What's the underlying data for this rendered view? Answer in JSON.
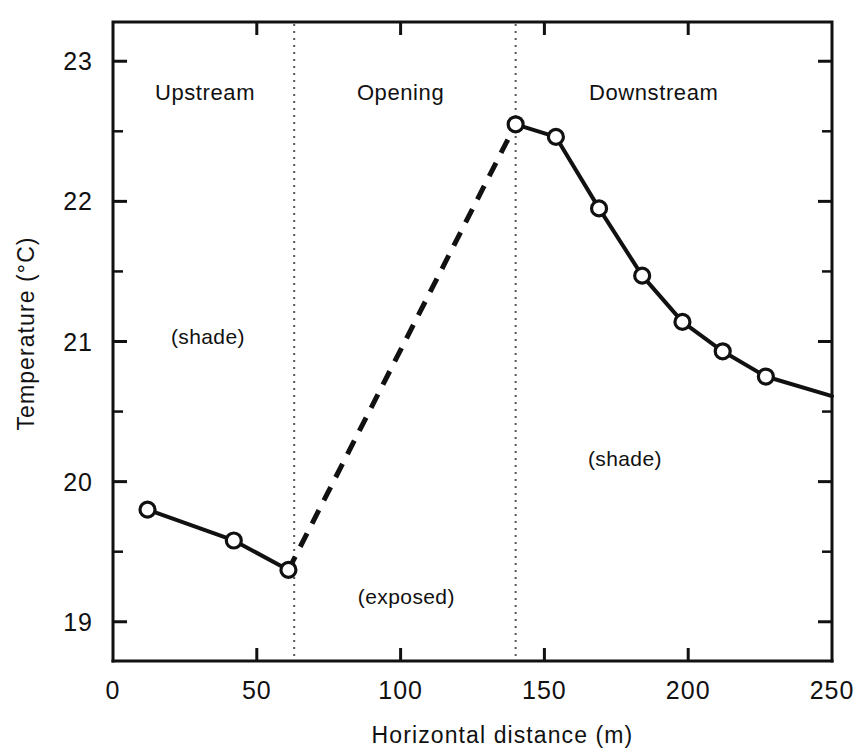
{
  "chart_data": {
    "type": "line",
    "title": "",
    "xlabel": "Horizontal distance  (m)",
    "ylabel": "Temperature  (°C)",
    "xlim": [
      0,
      250
    ],
    "ylim": [
      18.72,
      23.28
    ],
    "grid": false,
    "legend": "none",
    "x_ticks": [
      0,
      50,
      100,
      150,
      200,
      250
    ],
    "x_tick_labels": [
      "0",
      "50",
      "100",
      "150",
      "200",
      "250"
    ],
    "x_minor_ticks": [
      25,
      75,
      125,
      175,
      225
    ],
    "y_ticks": [
      19,
      20,
      21,
      22,
      23
    ],
    "y_tick_labels": [
      "19",
      "20",
      "21",
      "22",
      "23"
    ],
    "y_minor_ticks": [
      19.5,
      20.5,
      21.5,
      22.5
    ],
    "series": [
      {
        "name": "Upstream (shade)",
        "style": "solid",
        "marker": "open-circle",
        "points": [
          {
            "x": 12,
            "y": 19.8
          },
          {
            "x": 42,
            "y": 19.58
          },
          {
            "x": 61,
            "y": 19.37
          }
        ]
      },
      {
        "name": "Opening (exposed)",
        "style": "dashed",
        "marker": "none",
        "points": [
          {
            "x": 61,
            "y": 19.37
          },
          {
            "x": 140,
            "y": 22.55
          }
        ]
      },
      {
        "name": "Downstream (shade)",
        "style": "solid",
        "marker": "open-circle",
        "points": [
          {
            "x": 140,
            "y": 22.55
          },
          {
            "x": 154,
            "y": 22.46
          },
          {
            "x": 169,
            "y": 21.95
          },
          {
            "x": 184,
            "y": 21.47
          },
          {
            "x": 198,
            "y": 21.14
          },
          {
            "x": 212,
            "y": 20.93
          },
          {
            "x": 227,
            "y": 20.75
          },
          {
            "x": 250,
            "y": 20.61
          }
        ]
      }
    ],
    "dividers": [
      {
        "x": 63,
        "label": "upstream-opening-boundary"
      },
      {
        "x": 140,
        "label": "opening-downstream-boundary"
      }
    ],
    "region_labels": [
      {
        "text": "Upstream",
        "x": 32,
        "y": 22.72
      },
      {
        "text": "Opening",
        "x": 100,
        "y": 22.72
      },
      {
        "text": "Downstream",
        "x": 188,
        "y": 22.72
      }
    ],
    "annotations": [
      {
        "text": "(shade)",
        "x": 33,
        "y": 20.98
      },
      {
        "text": "(exposed)",
        "x": 102,
        "y": 19.13
      },
      {
        "text": "(shade)",
        "x": 178,
        "y": 20.11
      }
    ],
    "colors": {
      "line": "#111111",
      "marker_fill": "#ffffff",
      "axis": "#111111",
      "divider": "#555555",
      "background": "#ffffff"
    }
  }
}
